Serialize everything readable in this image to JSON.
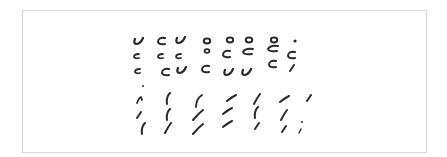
{
  "sheet": {
    "border_color": "#d6d6d6",
    "background": "#ffffff"
  },
  "ink_color": "#2a2a2a",
  "groups": [
    {
      "name": "curved-strokes",
      "marks": [
        {
          "x": 139,
          "y": 41,
          "shape": "hook"
        },
        {
          "x": 162,
          "y": 41,
          "shape": "c"
        },
        {
          "x": 181,
          "y": 40,
          "shape": "hook"
        },
        {
          "x": 207,
          "y": 41,
          "shape": "o"
        },
        {
          "x": 230,
          "y": 40,
          "shape": "o"
        },
        {
          "x": 249,
          "y": 40,
          "shape": "o"
        },
        {
          "x": 274,
          "y": 40,
          "shape": "o"
        },
        {
          "x": 295,
          "y": 41,
          "shape": "dot"
        },
        {
          "x": 137,
          "y": 56,
          "shape": "c-small"
        },
        {
          "x": 161,
          "y": 56,
          "shape": "c-small"
        },
        {
          "x": 179,
          "y": 56,
          "shape": "c-small"
        },
        {
          "x": 207,
          "y": 51,
          "shape": "o-small"
        },
        {
          "x": 227,
          "y": 54,
          "shape": "c"
        },
        {
          "x": 248,
          "y": 52,
          "shape": "c-wide"
        },
        {
          "x": 273,
          "y": 49,
          "shape": "c-wide"
        },
        {
          "x": 292,
          "y": 55,
          "shape": "c"
        },
        {
          "x": 138,
          "y": 71,
          "shape": "c-small"
        },
        {
          "x": 166,
          "y": 72,
          "shape": "c"
        },
        {
          "x": 182,
          "y": 70,
          "shape": "hook"
        },
        {
          "x": 206,
          "y": 69,
          "shape": "c"
        },
        {
          "x": 229,
          "y": 72,
          "shape": "hook"
        },
        {
          "x": 247,
          "y": 72,
          "shape": "hook"
        },
        {
          "x": 273,
          "y": 64,
          "shape": "c"
        },
        {
          "x": 292,
          "y": 68,
          "shape": "slash-short"
        },
        {
          "x": 143,
          "y": 86,
          "shape": "dot-tiny"
        }
      ]
    },
    {
      "name": "slanted-strokes",
      "marks": [
        {
          "x": 140,
          "y": 100,
          "shape": "caret"
        },
        {
          "x": 168,
          "y": 99,
          "shape": "paren"
        },
        {
          "x": 198,
          "y": 101,
          "shape": "paren-long"
        },
        {
          "x": 232,
          "y": 98,
          "shape": "dash-up"
        },
        {
          "x": 257,
          "y": 99,
          "shape": "slash"
        },
        {
          "x": 285,
          "y": 99,
          "shape": "dash-up"
        },
        {
          "x": 309,
          "y": 98,
          "shape": "slash-short"
        },
        {
          "x": 139,
          "y": 115,
          "shape": "slash-short"
        },
        {
          "x": 168,
          "y": 115,
          "shape": "paren"
        },
        {
          "x": 198,
          "y": 115,
          "shape": "slash-long"
        },
        {
          "x": 228,
          "y": 111,
          "shape": "dash-up"
        },
        {
          "x": 256,
          "y": 113,
          "shape": "paren"
        },
        {
          "x": 284,
          "y": 115,
          "shape": "slash"
        },
        {
          "x": 143,
          "y": 129,
          "shape": "paren"
        },
        {
          "x": 168,
          "y": 128,
          "shape": "slash"
        },
        {
          "x": 198,
          "y": 129,
          "shape": "slash-long"
        },
        {
          "x": 228,
          "y": 124,
          "shape": "dash-up"
        },
        {
          "x": 257,
          "y": 126,
          "shape": "slash-short"
        },
        {
          "x": 284,
          "y": 129,
          "shape": "slash-short"
        },
        {
          "x": 302,
          "y": 122,
          "shape": "dot-tiny"
        },
        {
          "x": 300,
          "y": 131,
          "shape": "slash-tiny"
        }
      ]
    }
  ]
}
